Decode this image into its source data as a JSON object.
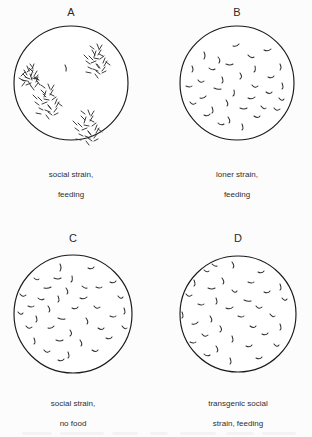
{
  "figure": {
    "type": "scientific-figure",
    "background_color": "#fcfcfc",
    "outline_color": "#1a1a1a",
    "worm_color": "#2e2e2e"
  },
  "panels": [
    {
      "id": "A",
      "label": "A",
      "caption": "social strain,\nfeeding",
      "caption_line1": "social strain,",
      "caption_line2": "feeding",
      "distribution": "clustered",
      "cluster_count": 4,
      "worm_count_approx": 85,
      "plate": {
        "cx": 71,
        "cy": 83,
        "r": 57
      },
      "label_pos": {
        "x": 71,
        "y": 8
      },
      "caption_pos": {
        "x": 71,
        "y": 162
      }
    },
    {
      "id": "B",
      "label": "B",
      "caption": "loner strain,\nfeeding",
      "caption_line1": "loner strain,",
      "caption_line2": "feeding",
      "distribution": "dispersed",
      "cluster_count": 0,
      "worm_count_approx": 34,
      "plate": {
        "cx": 237,
        "cy": 83,
        "r": 57
      },
      "label_pos": {
        "x": 237,
        "y": 8
      },
      "caption_pos": {
        "x": 237,
        "y": 162
      }
    },
    {
      "id": "C",
      "label": "C",
      "caption": "social strain,\nno food",
      "caption_line1": "social strain,",
      "caption_line2": "no food",
      "distribution": "dispersed",
      "cluster_count": 0,
      "worm_count_approx": 38,
      "plate": {
        "cx": 73,
        "cy": 314,
        "r": 59
      },
      "label_pos": {
        "x": 73,
        "y": 234
      },
      "caption_pos": {
        "x": 73,
        "y": 391
      }
    },
    {
      "id": "D",
      "label": "D",
      "caption": "transgenic social\nstrain, feeding",
      "caption_line1": "transgenic social",
      "caption_line2": "strain, feeding",
      "distribution": "dispersed",
      "cluster_count": 0,
      "worm_count_approx": 36,
      "plate": {
        "cx": 238,
        "cy": 314,
        "r": 58
      },
      "label_pos": {
        "x": 238,
        "y": 234
      },
      "caption_pos": {
        "x": 238,
        "y": 391
      }
    }
  ]
}
